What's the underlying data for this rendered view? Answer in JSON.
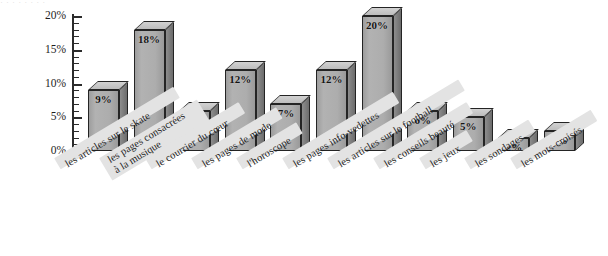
{
  "title_remnant": "· · ·   · ·   ·     ·        ·",
  "colors": {
    "bar_front": "#adadad",
    "bar_top": "#c8c8c8",
    "bar_side": "#7a7a7a",
    "outline": "#242424",
    "label_band": "#e3e3e3",
    "axis": "#2b2b2b",
    "background": "#ffffff"
  },
  "axis": {
    "y_ticks": [
      "0%",
      "5%",
      "10%",
      "15%",
      "20%"
    ],
    "y_values": [
      0,
      5,
      10,
      15,
      20
    ],
    "minor_tick_step": 1
  },
  "chart_data": {
    "type": "bar",
    "title": "",
    "xlabel": "",
    "ylabel": "",
    "ylim": [
      0,
      20
    ],
    "grid": false,
    "legend": "none",
    "categories": [
      "les articles sur le skate",
      "les pages consacrées à la musique",
      "le courrier du cœur",
      "les pages de mode",
      "l'horoscope",
      "les pages info-vedettes",
      "les articles sur le football",
      "les conseils beauté",
      "les jeux",
      "les sondages",
      "les mots-croisés"
    ],
    "values": [
      9,
      18,
      6,
      12,
      7,
      12,
      20,
      6,
      5,
      2,
      3
    ],
    "data_labels": [
      "9%",
      "18%",
      "6%",
      "12%",
      "7%",
      "12%",
      "20%",
      "6%",
      "5%",
      "2%",
      "3%"
    ],
    "ytick_labels": [
      "0%",
      "5%",
      "10%",
      "15%",
      "20%"
    ],
    "ytick_values": [
      0,
      5,
      10,
      15,
      20
    ]
  },
  "categories_display": [
    {
      "line1": "les articles sur le skate",
      "line2": ""
    },
    {
      "line1": "les pages consacrées",
      "line2": "à la musique"
    },
    {
      "line1": "le courrier du cœur",
      "line2": ""
    },
    {
      "line1": "les pages de mode",
      "line2": ""
    },
    {
      "line1": "l'horoscope",
      "line2": ""
    },
    {
      "line1": "les pages info-vedettes",
      "line2": ""
    },
    {
      "line1": "les articles sur le football",
      "line2": ""
    },
    {
      "line1": "les conseils beauté",
      "line2": ""
    },
    {
      "line1": "les jeux",
      "line2": ""
    },
    {
      "line1": "les sondages",
      "line2": ""
    },
    {
      "line1": "les mots-croisés",
      "line2": ""
    }
  ]
}
